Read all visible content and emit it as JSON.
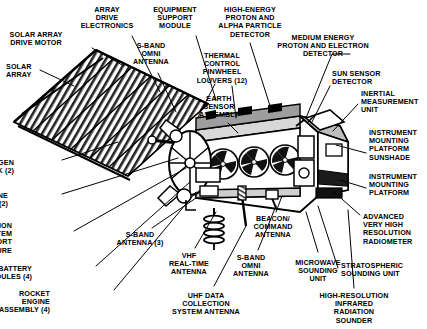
{
  "diagram": {
    "background_color": "#ffffff",
    "ink_color": "#000000",
    "labels": [
      {
        "id": "solar-array-drive-motor",
        "text": "SOLAR ARRAY\nDRIVE MOTOR",
        "align": "center",
        "x": 36,
        "y": 31
      },
      {
        "id": "array-drive-electronics",
        "text": "ARRAY\nDRIVE\nELECTRONICS",
        "align": "center",
        "x": 107,
        "y": 6
      },
      {
        "id": "equipment-support-module",
        "text": "EQUIPMENT\nSUPPORT\nMODULE",
        "align": "center",
        "x": 175,
        "y": 6
      },
      {
        "id": "solar-array",
        "text": "SOLAR\nARRAY",
        "align": "left",
        "x": 6,
        "y": 63
      },
      {
        "id": "s-band-omni-antenna-top",
        "text": "S-BAND\nOMNI\nANTENNA",
        "align": "center",
        "x": 151,
        "y": 42
      },
      {
        "id": "thermal-control-pinwheel-louvers",
        "text": "THERMAL\nCONTROL\nPINWHEEL\nLOUVERS (12)",
        "align": "center",
        "x": 222,
        "y": 52
      },
      {
        "id": "high-energy-proton-alpha-particle-detector",
        "text": "HIGH-ENERGY\nPROTON AND\nALPHA PARTICLE\nDETECTOR",
        "align": "center",
        "x": 250,
        "y": 6
      },
      {
        "id": "medium-energy-proton-electron-detector",
        "text": "MEDIUM ENERGY\nPROTON AND ELECTRON\nDETECTOR",
        "align": "center",
        "x": 323,
        "y": 34
      },
      {
        "id": "earth-sensor-assembly",
        "text": "EARTH\nSENSOR\nASSEMBLY",
        "align": "center",
        "x": 219,
        "y": 95
      },
      {
        "id": "sun-sensor-detector",
        "text": "SUN SENSOR\nDETECTOR",
        "align": "left",
        "x": 332,
        "y": 70
      },
      {
        "id": "inertial-measurement-unit",
        "text": "INERTIAL\nMEASUREMENT\nUNIT",
        "align": "left",
        "x": 361,
        "y": 90
      },
      {
        "id": "instrument-mounting-platform-sunshade",
        "text": "INSTRUMENT\nMOUNTING\nPLATFORM\nSUNSHADE",
        "align": "left",
        "x": 369,
        "y": 129
      },
      {
        "id": "instrument-mounting-platform",
        "text": "INSTRUMENT\nMOUNTING\nPLATFORM",
        "align": "left",
        "x": 369,
        "y": 173
      },
      {
        "id": "advanced-very-high-resolution-radiometer",
        "text": "ADVANCED\nVERY HIGH\nRESOLUTION\nRADIOMETER",
        "align": "left",
        "x": 363,
        "y": 213
      },
      {
        "id": "stratospheric-sounding-unit",
        "text": "STRATOSPHERIC\nSOUNDING UNIT",
        "align": "left",
        "x": 341,
        "y": 262
      },
      {
        "id": "high-resolution-infrared-radiation-sounder",
        "text": "HIGH-RESOLUTION\nINFRARED\nRADIATION\nSOUNDER",
        "align": "center",
        "x": 354,
        "y": 292
      },
      {
        "id": "nitrogen-tank",
        "text": "NITROGEN\nTANK (2)",
        "align": "right",
        "x": 14,
        "y": 159
      },
      {
        "id": "hydrazine-tank",
        "text": "HYDRAZINE\nTANK (2)",
        "align": "right",
        "x": 8,
        "y": 192
      },
      {
        "id": "reaction-system-support-structure",
        "text": "REACTION\nSYSTEM\nSUPPORT\nSTRUCTURE",
        "align": "right",
        "x": 12,
        "y": 222
      },
      {
        "id": "battery-modules",
        "text": "BATTERY\nMODULES (4)",
        "align": "right",
        "x": 32,
        "y": 265
      },
      {
        "id": "rocket-engine-assembly",
        "text": "ROCKET\nENGINE\nASSEMBLY (4)",
        "align": "right",
        "x": 50,
        "y": 290
      },
      {
        "id": "s-band-antenna-3",
        "text": "S-BAND\nANTENNA (3)",
        "align": "center",
        "x": 140,
        "y": 231
      },
      {
        "id": "vhf-real-time-antenna",
        "text": "VHF\nREAL-TIME\nANTENNA",
        "align": "center",
        "x": 189,
        "y": 252
      },
      {
        "id": "uhf-data-collection-system-antenna",
        "text": "UHF DATA\nCOLLECTION\nSYSTEM ANTENNA",
        "align": "center",
        "x": 206,
        "y": 292
      },
      {
        "id": "s-band-omni-antenna-bottom",
        "text": "S-BAND\nOMNI\nANTENNA",
        "align": "center",
        "x": 251,
        "y": 254
      },
      {
        "id": "beacon-command-antenna",
        "text": "BEACON/\nCOMMAND\nANTENNA",
        "align": "center",
        "x": 273,
        "y": 215
      },
      {
        "id": "microwave-sounding-unit",
        "text": "MICROWAVE\nSOUNDING\nUNIT",
        "align": "center",
        "x": 318,
        "y": 259
      }
    ],
    "leader_lines": [
      {
        "id": "leader-solar-array-drive-motor",
        "points": "92,48 124,66"
      },
      {
        "id": "leader-array-drive-electronics",
        "points": "132,36 160,92"
      },
      {
        "id": "leader-equipment-support-module",
        "points": "196,36 216,100"
      },
      {
        "id": "leader-solar-array",
        "points": "40,70 74,86"
      },
      {
        "id": "leader-s-band-omni-top",
        "points": "158,73 176,112"
      },
      {
        "id": "leader-thermal-louvers",
        "points": "215,84 198,117"
      },
      {
        "id": "leader-pinwheel-2",
        "points": "232,86 236,118"
      },
      {
        "id": "leader-high-energy-proton",
        "points": "250,43 272,112"
      },
      {
        "id": "leader-medium-energy-proton",
        "points": "330,54 332,54 306,118"
      },
      {
        "id": "leader-earth-sensor",
        "points": "228,123 238,133"
      },
      {
        "id": "leader-sun-sensor",
        "points": "330,86 312,122"
      },
      {
        "id": "leader-imu",
        "points": "358,104 333,131"
      },
      {
        "id": "leader-imp-sunshade",
        "points": "366,153 336,145"
      },
      {
        "id": "leader-imp",
        "points": "366,188 340,180"
      },
      {
        "id": "leader-avhrr",
        "points": "360,215 334,192"
      },
      {
        "id": "leader-ssu",
        "points": "338,268 318,206"
      },
      {
        "id": "leader-hirs",
        "points": "354,288 348,210"
      },
      {
        "id": "leader-nitrogen",
        "points": "62,160 118,142"
      },
      {
        "id": "leader-hydrazine",
        "points": "62,194 178,158"
      },
      {
        "id": "leader-reaction-system",
        "points": "74,231 186,168"
      },
      {
        "id": "leader-battery",
        "points": "96,266 190,182"
      },
      {
        "id": "leader-rocket-engine",
        "points": "114,290 196,192"
      },
      {
        "id": "leader-s-band-3",
        "points": "152,228 196,198"
      },
      {
        "id": "leader-vhf",
        "points": "195,248 216,212"
      },
      {
        "id": "leader-uhf",
        "points": "214,286 246,226"
      },
      {
        "id": "leader-s-band-omni-bottom",
        "points": "258,250 276,206"
      },
      {
        "id": "leader-beacon",
        "points": "276,212 282,196"
      },
      {
        "id": "leader-msu",
        "points": "318,252 306,212"
      }
    ]
  }
}
